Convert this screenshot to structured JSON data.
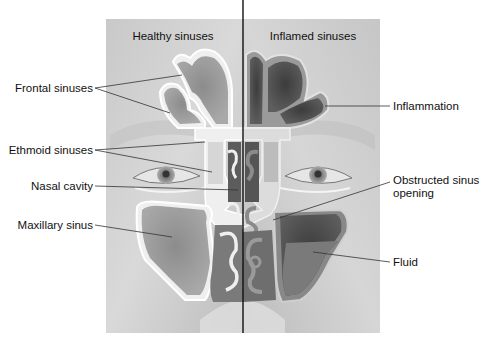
{
  "figure": {
    "type": "anatomical-illustration"
  },
  "panels": {
    "left": {
      "title": "Healthy sinuses"
    },
    "right": {
      "title": "Inflamed sinuses"
    }
  },
  "labels": {
    "left": [
      {
        "id": "frontal",
        "text": "Frontal sinuses"
      },
      {
        "id": "ethmoid",
        "text": "Ethmoid sinuses"
      },
      {
        "id": "nasal",
        "text": "Nasal cavity"
      },
      {
        "id": "maxillary",
        "text": "Maxillary sinus"
      }
    ],
    "right": [
      {
        "id": "inflammation",
        "text": "Inflammation"
      },
      {
        "id": "obstructed",
        "text": "Obstructed sinus",
        "text2": "opening"
      },
      {
        "id": "fluid",
        "text": "Fluid"
      }
    ]
  },
  "colors": {
    "background": "#ffffff",
    "skin_light": "#d4d4d4",
    "skin_mid": "#b8b8b8",
    "bone": "#eeeeee",
    "cavity_healthy": "#8a8a8a",
    "cavity_inflamed": "#4a4a4a",
    "mucosa_inflamed": "#7d7d7d",
    "fluid": "#777777",
    "divider": "#111111",
    "leader": "#333333"
  }
}
